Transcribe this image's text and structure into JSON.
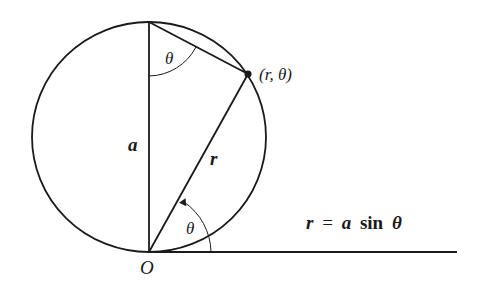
{
  "diagram": {
    "labels": {
      "top_angle": "θ",
      "point": "(r, θ)",
      "diameter": "a",
      "radius": "r",
      "bottom_angle": "θ",
      "origin": "O"
    },
    "equation": {
      "lhs": "r",
      "eq": "=",
      "a": "a",
      "fn": "sin",
      "theta": "θ"
    },
    "colors": {
      "ink": "#1a1a1a",
      "background": "#ffffff"
    }
  }
}
